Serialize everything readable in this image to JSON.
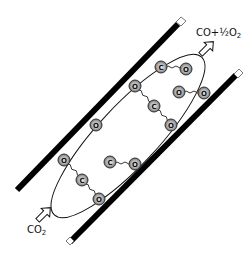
{
  "diagram": {
    "labels": {
      "product": {
        "main": "CO+½O",
        "sub": "2"
      },
      "reactant": {
        "main": "CO",
        "sub": "2"
      }
    },
    "colors": {
      "wall": "#000000",
      "atom_fill": "#9a9a9a",
      "atom_ring": "#3a3a3a",
      "atom_inner": "#d8d8d8",
      "line": "#111111",
      "arrow_fill": "#ffffff"
    },
    "atoms": [
      {
        "id": "c1",
        "element": "C",
        "x": 161,
        "y": 67
      },
      {
        "id": "o1",
        "element": "O",
        "x": 186,
        "y": 69
      },
      {
        "id": "o2",
        "element": "O",
        "x": 135,
        "y": 86
      },
      {
        "id": "c2",
        "element": "C",
        "x": 154,
        "y": 106
      },
      {
        "id": "o3",
        "element": "O",
        "x": 171,
        "y": 125
      },
      {
        "id": "o4",
        "element": "O",
        "x": 179,
        "y": 92
      },
      {
        "id": "o5",
        "element": "O",
        "x": 204,
        "y": 93
      },
      {
        "id": "o6",
        "element": "O",
        "x": 96,
        "y": 125
      },
      {
        "id": "o7",
        "element": "O",
        "x": 64,
        "y": 160
      },
      {
        "id": "c3",
        "element": "C",
        "x": 82,
        "y": 180
      },
      {
        "id": "o8",
        "element": "O",
        "x": 99,
        "y": 199
      },
      {
        "id": "c4",
        "element": "C",
        "x": 110,
        "y": 162
      },
      {
        "id": "o9",
        "element": "O",
        "x": 135,
        "y": 164
      }
    ],
    "wavy_bonds": [
      [
        "c1",
        "o1"
      ],
      [
        "o2",
        "c2"
      ],
      [
        "c2",
        "o3"
      ],
      [
        "o4",
        "o5"
      ],
      [
        "o7",
        "c3"
      ],
      [
        "c3",
        "o8"
      ],
      [
        "c4",
        "o9"
      ]
    ],
    "straight_bonds": [
      [
        "o2",
        "c1"
      ]
    ]
  }
}
